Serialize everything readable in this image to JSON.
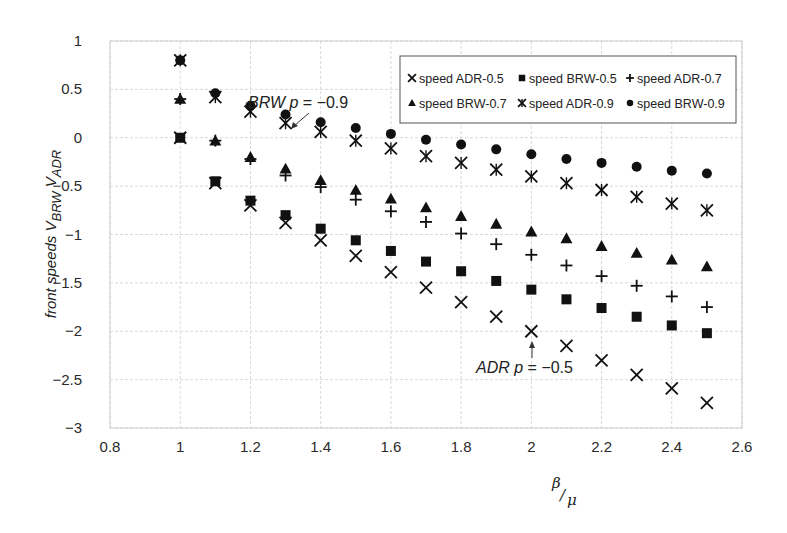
{
  "chart_data": {
    "type": "scatter",
    "title": "",
    "xlabel": "β/μ",
    "xlabel_parts": {
      "num": "β",
      "den": "μ"
    },
    "ylabel": "front speeds V_BRW V_ADR",
    "ylabel_parts": {
      "prefix": "front speeds V",
      "sub1": "BRW",
      "mid": " V",
      "sub2": "ADR"
    },
    "xlim": [
      0.8,
      2.6
    ],
    "ylim": [
      -3,
      1
    ],
    "xticks": [
      0.8,
      1,
      1.2,
      1.4,
      1.6,
      1.8,
      2,
      2.2,
      2.4,
      2.6
    ],
    "xtick_labels": [
      "0.8",
      "1",
      "1.2",
      "1.4",
      "1.6",
      "1.8",
      "2",
      "2.2",
      "2.4",
      "2.6"
    ],
    "yticks": [
      1,
      0.5,
      0,
      -0.5,
      -1,
      -1.5,
      -2,
      -2.5,
      -3
    ],
    "ytick_labels": [
      "1",
      "0.5",
      "0",
      "−0.5",
      "−1",
      "−1.5",
      "−2",
      "−2.5",
      "−3"
    ],
    "grid": true,
    "legend_position": "top-right",
    "x": [
      1.0,
      1.1,
      1.2,
      1.3,
      1.4,
      1.5,
      1.6,
      1.7,
      1.8,
      1.9,
      2.0,
      2.1,
      2.2,
      2.3,
      2.4,
      2.5
    ],
    "series": [
      {
        "name": "speed ADR-0.5",
        "marker": "x",
        "values": [
          0.0,
          -0.47,
          -0.7,
          -0.88,
          -1.06,
          -1.22,
          -1.39,
          -1.55,
          -1.7,
          -1.85,
          -2.0,
          -2.15,
          -2.3,
          -2.45,
          -2.59,
          -2.74
        ]
      },
      {
        "name": "speed BRW-0.5",
        "marker": "square",
        "values": [
          0.0,
          -0.45,
          -0.65,
          -0.8,
          -0.94,
          -1.06,
          -1.17,
          -1.28,
          -1.38,
          -1.48,
          -1.57,
          -1.67,
          -1.76,
          -1.85,
          -1.94,
          -2.02
        ]
      },
      {
        "name": "speed ADR-0.7",
        "marker": "plus",
        "values": [
          0.4,
          -0.03,
          -0.22,
          -0.39,
          -0.51,
          -0.64,
          -0.76,
          -0.87,
          -0.99,
          -1.1,
          -1.21,
          -1.32,
          -1.43,
          -1.53,
          -1.64,
          -1.75
        ]
      },
      {
        "name": "speed BRW-0.7",
        "marker": "triangle",
        "values": [
          0.4,
          -0.03,
          -0.2,
          -0.32,
          -0.44,
          -0.54,
          -0.63,
          -0.72,
          -0.81,
          -0.89,
          -0.97,
          -1.04,
          -1.12,
          -1.19,
          -1.26,
          -1.33
        ]
      },
      {
        "name": "speed ADR-0.9",
        "marker": "asterisk",
        "values": [
          0.8,
          0.42,
          0.27,
          0.15,
          0.06,
          -0.03,
          -0.11,
          -0.19,
          -0.26,
          -0.33,
          -0.4,
          -0.47,
          -0.54,
          -0.61,
          -0.68,
          -0.75
        ]
      },
      {
        "name": "speed BRW-0.9",
        "marker": "circle",
        "values": [
          0.8,
          0.46,
          0.33,
          0.24,
          0.16,
          0.1,
          0.04,
          -0.02,
          -0.07,
          -0.12,
          -0.17,
          -0.22,
          -0.26,
          -0.3,
          -0.34,
          -0.37
        ]
      }
    ],
    "annotations": [
      {
        "text_parts": {
          "a": "BRW ",
          "b": "p",
          "c": " = −0.9"
        },
        "text": "BRW p = −0.9",
        "points_to": [
          1.3,
          0.24
        ]
      },
      {
        "text_parts": {
          "a": "ADR ",
          "b": "p",
          "c": " = −0.5"
        },
        "text": "ADR p = −0.5",
        "points_to": [
          2.0,
          -2.0
        ]
      }
    ],
    "colors": {
      "marker": "#111111",
      "grid": "#d8d8d8",
      "text": "#2a2a2a"
    }
  }
}
